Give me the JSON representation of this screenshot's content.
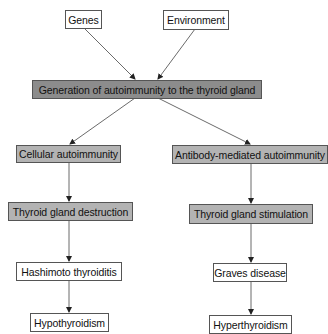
{
  "diagram": {
    "nodes": {
      "genes": "Genes",
      "environment": "Environment",
      "generation": "Generation of autoimmunity to the thyroid gland",
      "cellular": "Cellular autoimmunity",
      "antibody": "Antibody-mediated autoimmunity",
      "destruction": "Thyroid gland destruction",
      "stimulation": "Thyroid gland stimulation",
      "hashimoto": "Hashimoto thyroiditis",
      "graves": "Graves disease",
      "hypo": "Hypothyroidism",
      "hyper": "Hyperthyroidism"
    },
    "edges": [
      [
        "genes",
        "generation"
      ],
      [
        "environment",
        "generation"
      ],
      [
        "generation",
        "cellular"
      ],
      [
        "generation",
        "antibody"
      ],
      [
        "cellular",
        "destruction"
      ],
      [
        "antibody",
        "stimulation"
      ],
      [
        "destruction",
        "hashimoto"
      ],
      [
        "stimulation",
        "graves"
      ],
      [
        "hashimoto",
        "hypo"
      ],
      [
        "graves",
        "hyper"
      ]
    ],
    "colors": {
      "dark_fill": "#8c8c8c",
      "light_fill": "#b3b3b3",
      "white_fill": "#ffffff",
      "border": "#555555",
      "arrow": "#333333"
    }
  }
}
